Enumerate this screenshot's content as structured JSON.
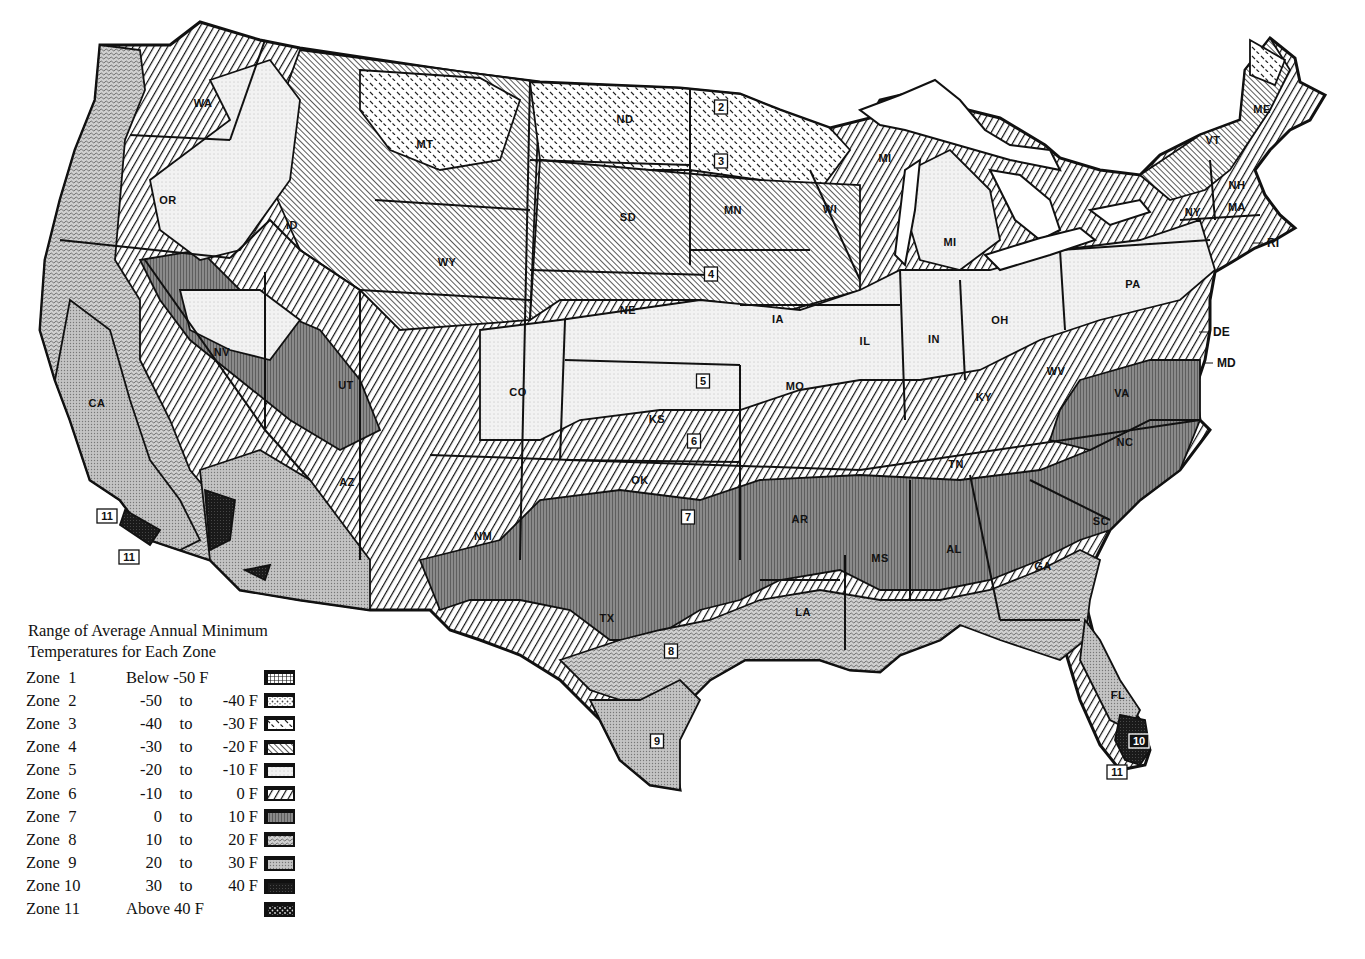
{
  "map": {
    "title": "USDA Plant Hardiness Zone Map (contiguous United States)",
    "state_labels": [
      {
        "abbr": "WA",
        "x": 203,
        "y": 107
      },
      {
        "abbr": "OR",
        "x": 168,
        "y": 204
      },
      {
        "abbr": "ID",
        "x": 292,
        "y": 229
      },
      {
        "abbr": "MT",
        "x": 425,
        "y": 148
      },
      {
        "abbr": "WY",
        "x": 447,
        "y": 266
      },
      {
        "abbr": "ND",
        "x": 625,
        "y": 123
      },
      {
        "abbr": "SD",
        "x": 628,
        "y": 221
      },
      {
        "abbr": "NE",
        "x": 628,
        "y": 314
      },
      {
        "abbr": "MN",
        "x": 733,
        "y": 214
      },
      {
        "abbr": "WI",
        "x": 830,
        "y": 213
      },
      {
        "abbr": "MI",
        "x": 885,
        "y": 162
      },
      {
        "abbr": "MI",
        "x": 950,
        "y": 246
      },
      {
        "abbr": "IA",
        "x": 778,
        "y": 323
      },
      {
        "abbr": "IL",
        "x": 865,
        "y": 345
      },
      {
        "abbr": "IN",
        "x": 934,
        "y": 343
      },
      {
        "abbr": "OH",
        "x": 1000,
        "y": 324
      },
      {
        "abbr": "NV",
        "x": 222,
        "y": 356
      },
      {
        "abbr": "UT",
        "x": 346,
        "y": 389
      },
      {
        "abbr": "CO",
        "x": 518,
        "y": 396
      },
      {
        "abbr": "KS",
        "x": 657,
        "y": 423
      },
      {
        "abbr": "MO",
        "x": 795,
        "y": 390
      },
      {
        "abbr": "KY",
        "x": 984,
        "y": 401
      },
      {
        "abbr": "WV",
        "x": 1056,
        "y": 375
      },
      {
        "abbr": "VA",
        "x": 1122,
        "y": 397
      },
      {
        "abbr": "PA",
        "x": 1133,
        "y": 288
      },
      {
        "abbr": "NY",
        "x": 1193,
        "y": 216
      },
      {
        "abbr": "VT",
        "x": 1213,
        "y": 144
      },
      {
        "abbr": "NH",
        "x": 1237,
        "y": 189
      },
      {
        "abbr": "MA",
        "x": 1237,
        "y": 211
      },
      {
        "abbr": "ME",
        "x": 1262,
        "y": 113
      },
      {
        "abbr": "CA",
        "x": 97,
        "y": 407
      },
      {
        "abbr": "AZ",
        "x": 347,
        "y": 486
      },
      {
        "abbr": "NM",
        "x": 483,
        "y": 540
      },
      {
        "abbr": "OK",
        "x": 640,
        "y": 484
      },
      {
        "abbr": "TX",
        "x": 607,
        "y": 622
      },
      {
        "abbr": "AR",
        "x": 800,
        "y": 523
      },
      {
        "abbr": "TN",
        "x": 956,
        "y": 468
      },
      {
        "abbr": "NC",
        "x": 1125,
        "y": 446
      },
      {
        "abbr": "SC",
        "x": 1101,
        "y": 525
      },
      {
        "abbr": "GA",
        "x": 1043,
        "y": 570
      },
      {
        "abbr": "AL",
        "x": 954,
        "y": 553
      },
      {
        "abbr": "MS",
        "x": 880,
        "y": 562
      },
      {
        "abbr": "LA",
        "x": 803,
        "y": 616
      },
      {
        "abbr": "FL",
        "x": 1118,
        "y": 699
      }
    ],
    "external_labels": [
      {
        "abbr": "DE",
        "x": 1213,
        "y": 336
      },
      {
        "abbr": "MD",
        "x": 1217,
        "y": 367
      },
      {
        "abbr": "RI",
        "x": 1267,
        "y": 247
      }
    ],
    "zone_markers": [
      {
        "zone": "2",
        "x": 721,
        "y": 107
      },
      {
        "zone": "3",
        "x": 721,
        "y": 161
      },
      {
        "zone": "4",
        "x": 711,
        "y": 274
      },
      {
        "zone": "5",
        "x": 703,
        "y": 381
      },
      {
        "zone": "6",
        "x": 694,
        "y": 441
      },
      {
        "zone": "7",
        "x": 688,
        "y": 517
      },
      {
        "zone": "8",
        "x": 671,
        "y": 651
      },
      {
        "zone": "9",
        "x": 657,
        "y": 741
      },
      {
        "zone": "10",
        "x": 1139,
        "y": 741,
        "dark": true
      },
      {
        "zone": "11",
        "x": 1117,
        "y": 772
      },
      {
        "zone": "11",
        "x": 107,
        "y": 516
      },
      {
        "zone": "11",
        "x": 129,
        "y": 557
      }
    ]
  },
  "legend": {
    "title_line1": "Range of Average Annual Minimum",
    "title_line2": "Temperatures for Each Zone",
    "zones": [
      {
        "label": "Zone  1",
        "range_text": "Below -50 F",
        "pattern": "pat-z1"
      },
      {
        "label": "Zone  2",
        "from": "-50",
        "to_word": "to",
        "to": "-40 F",
        "pattern": "pat-z2"
      },
      {
        "label": "Zone  3",
        "from": "-40",
        "to_word": "to",
        "to": "-30 F",
        "pattern": "pat-z3"
      },
      {
        "label": "Zone  4",
        "from": "-30",
        "to_word": "to",
        "to": "-20 F",
        "pattern": "pat-z4"
      },
      {
        "label": "Zone  5",
        "from": "-20",
        "to_word": "to",
        "to": "-10 F",
        "pattern": "pat-z5"
      },
      {
        "label": "Zone  6",
        "from": "-10",
        "to_word": "to",
        "to": "0 F",
        "pattern": "pat-z6"
      },
      {
        "label": "Zone  7",
        "from": "0",
        "to_word": "to",
        "to": "10 F",
        "pattern": "pat-z7"
      },
      {
        "label": "Zone  8",
        "from": "10",
        "to_word": "to",
        "to": "20 F",
        "pattern": "pat-z8"
      },
      {
        "label": "Zone  9",
        "from": "20",
        "to_word": "to",
        "to": "30 F",
        "pattern": "pat-z9"
      },
      {
        "label": "Zone 10",
        "from": "30",
        "to_word": "to",
        "to": "40 F",
        "pattern": "pat-z10"
      },
      {
        "label": "Zone 11",
        "range_text": "Above 40 F",
        "pattern": "pat-z11"
      }
    ]
  }
}
